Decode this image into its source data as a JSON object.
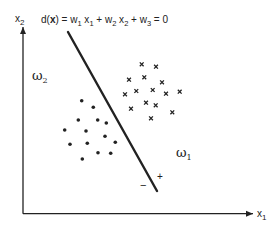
{
  "diagram": {
    "axes": {
      "x_label": "x",
      "x_sub": "1",
      "y_label": "x",
      "y_sub": "2",
      "origin": [
        23,
        213.7
      ],
      "x_end": 253,
      "y_end": 27
    },
    "equation": {
      "prefix": "d(",
      "bold_var": "x",
      "suffix": ") = w",
      "parts": [
        "d(",
        "x",
        ") = w",
        "1",
        " x",
        "1",
        " + w",
        "2",
        " x",
        "2",
        " + w",
        "3",
        " = 0"
      ]
    },
    "decision_line": {
      "x1": 68,
      "y1": 32,
      "x2": 157,
      "y2": 191,
      "stroke_width": 2.4
    },
    "signs": {
      "minus": "−",
      "plus": "+"
    },
    "class_labels": {
      "omega2": {
        "symbol": "ω",
        "sub": "2"
      },
      "omega1": {
        "symbol": "ω",
        "sub": "1"
      }
    },
    "class_omega1_points_cross": [
      [
        141.7,
        64.3
      ],
      [
        156,
        66.7
      ],
      [
        129,
        79.7
      ],
      [
        144.3,
        77.3
      ],
      [
        162,
        82.3
      ],
      [
        125,
        94.3
      ],
      [
        136.3,
        91
      ],
      [
        152.7,
        90
      ],
      [
        166,
        93.7
      ],
      [
        179.7,
        91.7
      ],
      [
        131,
        108.7
      ],
      [
        146,
        102.7
      ],
      [
        155.7,
        105.3
      ],
      [
        172.3,
        112.3
      ],
      [
        151,
        118.3
      ]
    ],
    "class_omega2_points_dot": [
      [
        81.7,
        100.7
      ],
      [
        93.3,
        107.3
      ],
      [
        78.3,
        120
      ],
      [
        97.7,
        120
      ],
      [
        106.3,
        123
      ],
      [
        64.7,
        130
      ],
      [
        86,
        131
      ],
      [
        105,
        136.3
      ],
      [
        70,
        144.3
      ],
      [
        87.3,
        143.3
      ],
      [
        115.3,
        142.3
      ],
      [
        98,
        152.7
      ],
      [
        110.7,
        153.3
      ],
      [
        82.3,
        159
      ]
    ],
    "colors": {
      "ink": "#222222",
      "background": "#ffffff"
    }
  }
}
